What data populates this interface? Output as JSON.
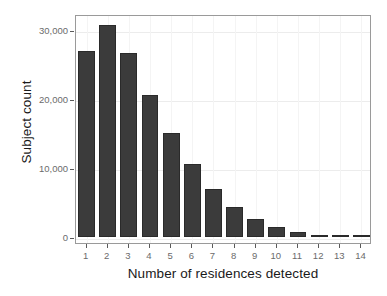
{
  "chart_data": {
    "type": "bar",
    "title": "",
    "xlabel": "Number of residences detected",
    "ylabel": "Subject count",
    "categories": [
      "1",
      "2",
      "3",
      "4",
      "5",
      "6",
      "7",
      "8",
      "9",
      "10",
      "11",
      "12",
      "13",
      "14"
    ],
    "values": [
      27000,
      30800,
      26700,
      20600,
      15100,
      10600,
      6900,
      4300,
      2600,
      1400,
      700,
      300,
      150,
      100
    ],
    "ylim": [
      0,
      31500
    ],
    "yticks": [
      0,
      10000,
      20000,
      30000
    ],
    "ytick_labels": [
      "0",
      "10,000",
      "20,000",
      "30,000"
    ],
    "xtick_labels": [
      "1",
      "2",
      "3",
      "4",
      "5",
      "6",
      "7",
      "8",
      "9",
      "10",
      "11",
      "12",
      "13",
      "14"
    ],
    "grid": true,
    "legend": "none",
    "bar_color": "#3b3b3b",
    "bar_edge_color": "#2a2a2a",
    "panel_border_color": "#9a9a9a",
    "grid_color": "#ececec",
    "axis_text_color": "#6b6b6b",
    "title_text_color": "#1a1a1a"
  }
}
